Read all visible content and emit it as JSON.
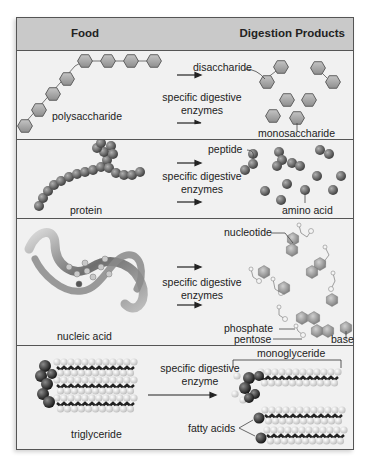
{
  "header": {
    "food": "Food",
    "products": "Digestion Products"
  },
  "rows": [
    {
      "food": "polysaccharide",
      "enzyme": [
        "specific digestive",
        "enzymes"
      ],
      "products": [
        "disaccharide",
        "monosaccharide"
      ]
    },
    {
      "food": "protein",
      "enzyme": [
        "specific digestive",
        "enzymes"
      ],
      "products": [
        "peptide",
        "amino acid"
      ]
    },
    {
      "food": "nucleic acid",
      "enzyme": [
        "specific digestive",
        "enzymes"
      ],
      "products": [
        "nucleotide",
        "phosphate",
        "pentose",
        "base"
      ]
    },
    {
      "food": "triglyceride",
      "enzyme": [
        "specific digestive",
        "enzyme"
      ],
      "products": [
        "monoglyceride",
        "fatty acids"
      ]
    }
  ],
  "colors": {
    "header_bg": "#c9c9c9",
    "body_bg": "#f1f1f1",
    "border": "#555555",
    "hexagon": "#a8a8a8",
    "sphere": "#6e6e6e",
    "sphere_dark": "#2b2b2b",
    "sphere_light": "#e8e8e8"
  }
}
